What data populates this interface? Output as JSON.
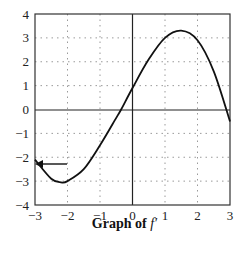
{
  "chart_data": {
    "type": "line",
    "title": "Graph of f′",
    "caption_prefix": "Graph of ",
    "caption_func": "f′",
    "xlabel": "",
    "ylabel": "",
    "xlim": [
      -3,
      3
    ],
    "ylim": [
      -4,
      4
    ],
    "x_ticks": [
      "−3",
      "−2",
      "−1",
      "0",
      "1",
      "2",
      "3"
    ],
    "y_ticks": [
      "4",
      "3",
      "2",
      "1",
      "0",
      "−1",
      "−2",
      "−3",
      "−4"
    ],
    "grid": "dotted",
    "series": [
      {
        "name": "f′",
        "x": [
          -3,
          -2.5,
          -2.2,
          -2,
          -1.5,
          -1,
          -0.5,
          -0.35,
          0,
          0.5,
          1,
          1.5,
          2,
          2.5,
          3
        ],
        "y": [
          -2.1,
          -2.9,
          -3.05,
          -3.0,
          -2.5,
          -1.5,
          -0.35,
          0,
          0.9,
          2.1,
          3.0,
          3.3,
          2.9,
          1.6,
          -0.5
        ]
      }
    ],
    "annotations": [
      {
        "type": "arrow",
        "target": [
          -3,
          -2.1
        ],
        "direction": "left"
      }
    ],
    "colors": {
      "line": "#111111",
      "grid": "#9a9a9a",
      "axes": "#222222"
    }
  }
}
